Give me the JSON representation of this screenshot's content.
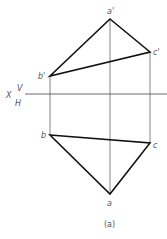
{
  "diagram": {
    "caption": "(a)",
    "axis": {
      "x_label": "X",
      "upper_label": "V",
      "lower_label": "H"
    },
    "points_v": {
      "a": "a'",
      "b": "b'",
      "c": "c'"
    },
    "points_h": {
      "a": "a",
      "b": "b",
      "c": "c"
    },
    "colors": {
      "edge": "#111111",
      "projector": "#666666",
      "axis": "#444444",
      "text": "#555555"
    }
  }
}
